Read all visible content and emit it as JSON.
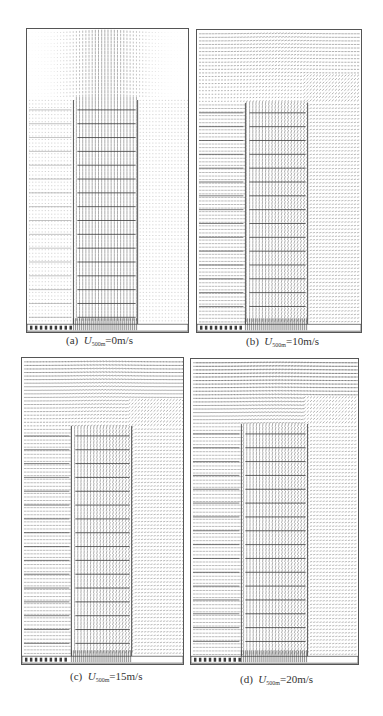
{
  "figure": {
    "panels": [
      {
        "id": "a",
        "label": "(a)",
        "var": "U",
        "sub": "500m",
        "value": "=0m/s",
        "wind_speed": 0,
        "box": {
          "x": 26,
          "y": 28,
          "w": 163,
          "h": 305
        },
        "shaft": {
          "x": 47,
          "w": 65,
          "top": 71
        },
        "caption_pos": {
          "x": 66,
          "y": 334
        }
      },
      {
        "id": "b",
        "label": "(b)",
        "var": "U",
        "sub": "500m",
        "value": "=10m/s",
        "wind_speed": 10,
        "box": {
          "x": 196,
          "y": 29,
          "w": 166,
          "h": 304
        },
        "shaft": {
          "x": 49,
          "w": 63,
          "top": 73
        },
        "caption_pos": {
          "x": 246,
          "y": 335
        }
      },
      {
        "id": "c",
        "label": "(c)",
        "var": "U",
        "sub": "500m",
        "value": "=15m/s",
        "wind_speed": 15,
        "box": {
          "x": 21,
          "y": 357,
          "w": 163,
          "h": 308
        },
        "shaft": {
          "x": 50,
          "w": 61,
          "top": 68
        },
        "caption_pos": {
          "x": 70,
          "y": 670
        }
      },
      {
        "id": "d",
        "label": "(d)",
        "var": "U",
        "sub": "500m",
        "value": "=20m/s",
        "wind_speed": 20,
        "box": {
          "x": 190,
          "y": 358,
          "w": 169,
          "h": 307
        },
        "shaft": {
          "x": 51,
          "w": 67,
          "top": 65
        },
        "caption_pos": {
          "x": 240,
          "y": 673
        }
      }
    ],
    "colors": {
      "line": "#555555",
      "vector": "#3a3a3a",
      "background": "#ffffff"
    }
  }
}
